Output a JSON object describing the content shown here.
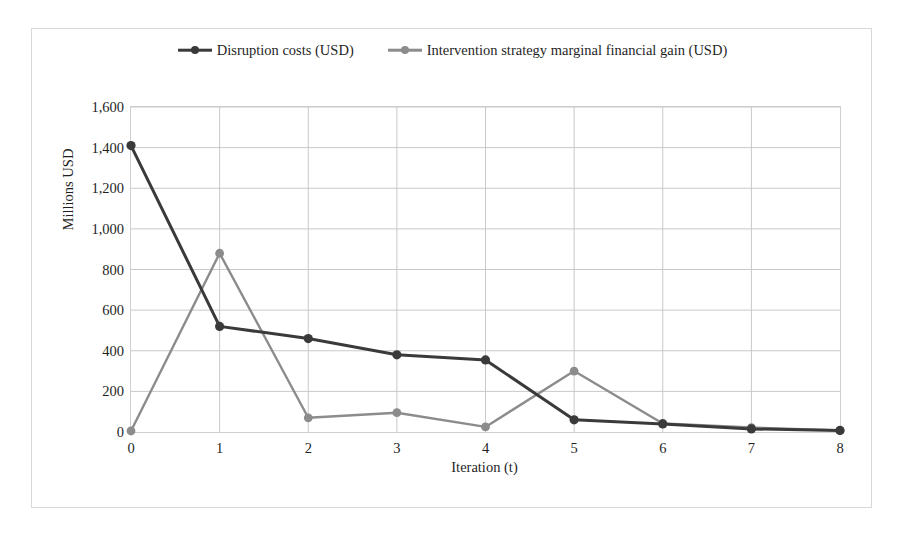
{
  "chart_data": {
    "type": "line",
    "title": "",
    "xlabel": "Iteration (t)",
    "ylabel": "Millions USD",
    "x": [
      0,
      1,
      2,
      3,
      4,
      5,
      6,
      7,
      8
    ],
    "xticklabels": [
      "0",
      "1",
      "2",
      "3",
      "4",
      "5",
      "6",
      "7",
      "8"
    ],
    "yticklabels": [
      "0",
      "200",
      "400",
      "600",
      "800",
      "1,000",
      "1,200",
      "1,400",
      "1,600"
    ],
    "yticks": [
      0,
      200,
      400,
      600,
      800,
      1000,
      1200,
      1400,
      1600
    ],
    "ylim": [
      0,
      1600
    ],
    "xlim": [
      0,
      8
    ],
    "grid": "both",
    "legend_position": "top-center",
    "series": [
      {
        "name": "Disruption costs (USD)",
        "color": "#3a3a3a",
        "marker": "circle",
        "values": [
          1410,
          520,
          460,
          380,
          355,
          60,
          40,
          15,
          8
        ]
      },
      {
        "name": "Intervention strategy marginal financial gain (USD)",
        "color": "#8c8c8c",
        "marker": "circle",
        "values": [
          5,
          880,
          70,
          95,
          25,
          300,
          42,
          22,
          8
        ]
      }
    ]
  },
  "legend": {
    "entries": [
      {
        "label": "Disruption costs (USD)"
      },
      {
        "label": "Intervention strategy marginal financial gain (USD)"
      }
    ]
  },
  "colors": {
    "series_dark": "#3a3a3a",
    "series_gray": "#8c8c8c",
    "gridline": "#c9c9c9",
    "border": "#d8d8d8",
    "text": "#1f1f1f"
  }
}
